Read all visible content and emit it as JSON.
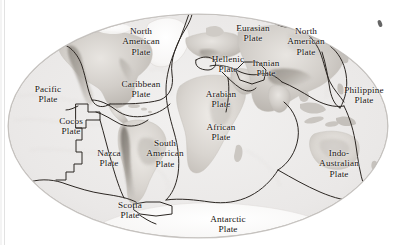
{
  "figure": {
    "kind": "world-map",
    "projection": "elliptical (Mollweide-style) world projection",
    "style": "grayscale shaded-relief scan",
    "background_color": "#ffffff",
    "ocean_color": "#eceaea",
    "land_color": "#d9d6d2",
    "boundary_color": "#2b2622",
    "outline_color": "#b9b6b2",
    "label_color": "#16120f"
  },
  "plates": [
    {
      "id": "pacific",
      "label": "Pacific\nPlate",
      "x": 12,
      "y": 84,
      "w": 72
    },
    {
      "id": "north-american-w",
      "label": "North\nAmerican\nPlate",
      "x": 102,
      "y": 26,
      "w": 78
    },
    {
      "id": "caribbean",
      "label": "Caribbean\nPlate",
      "x": 99,
      "y": 79,
      "w": 84
    },
    {
      "id": "cocos",
      "label": "Cocos\nPlate",
      "x": 40,
      "y": 116,
      "w": 62
    },
    {
      "id": "nazca",
      "label": "Nazca\nPlate",
      "x": 78,
      "y": 148,
      "w": 62
    },
    {
      "id": "south-american",
      "label": "South\nAmerican\nPlate",
      "x": 126,
      "y": 138,
      "w": 78
    },
    {
      "id": "scotia",
      "label": "Scotia\nPlate",
      "x": 100,
      "y": 200,
      "w": 60
    },
    {
      "id": "african",
      "label": "African\nPlate",
      "x": 188,
      "y": 122,
      "w": 66
    },
    {
      "id": "arabian",
      "label": "Arabian\nPlate",
      "x": 188,
      "y": 89,
      "w": 66
    },
    {
      "id": "hellenic",
      "label": "Hellenic\nPlate",
      "x": 200,
      "y": 54,
      "w": 56
    },
    {
      "id": "iranian",
      "label": "Iranian\nPlate",
      "x": 239,
      "y": 58,
      "w": 54
    },
    {
      "id": "eurasian",
      "label": "Eurasian\nPlate",
      "x": 222,
      "y": 23,
      "w": 62
    },
    {
      "id": "north-american-e",
      "label": "North\nAmerican\nPlate",
      "x": 275,
      "y": 26,
      "w": 62
    },
    {
      "id": "philippine",
      "label": "Philippine\nPlate",
      "x": 335,
      "y": 85,
      "w": 58
    },
    {
      "id": "indo-australian",
      "label": "Indo-\nAustralian\nPlate",
      "x": 295,
      "y": 148,
      "w": 88
    },
    {
      "id": "antarctic",
      "label": "Antarctic\nPlate",
      "x": 192,
      "y": 214,
      "w": 72
    }
  ]
}
